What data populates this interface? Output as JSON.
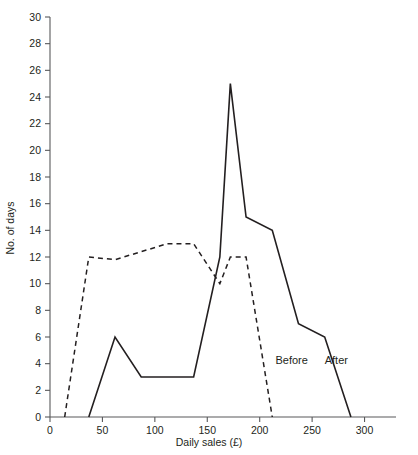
{
  "chart_data": {
    "type": "line",
    "title": "",
    "xlabel": "Daily sales (£)",
    "ylabel": "No. of days",
    "xlim": [
      0,
      330
    ],
    "ylim": [
      0,
      30
    ],
    "xticks": [
      0,
      50,
      100,
      150,
      200,
      250,
      300
    ],
    "yticks": [
      0,
      2,
      4,
      6,
      8,
      10,
      12,
      14,
      16,
      18,
      20,
      22,
      24,
      26,
      28,
      30
    ],
    "grid": false,
    "legend_position": "inline-annotations",
    "series": [
      {
        "name": "Before",
        "style": "dashed",
        "x": [
          14,
          37,
          62,
          87,
          112,
          137,
          162,
          172,
          187,
          212
        ],
        "y": [
          0,
          12,
          11.8,
          12.4,
          13,
          13,
          10,
          12,
          12,
          0
        ]
      },
      {
        "name": "After",
        "style": "solid",
        "x": [
          37,
          62,
          87,
          137,
          162,
          172,
          187,
          212,
          237,
          262,
          287
        ],
        "y": [
          0,
          6,
          3,
          3,
          12,
          25,
          15,
          14,
          7,
          6,
          0
        ]
      }
    ],
    "annotations": [
      {
        "text": "Before",
        "x": 215,
        "y": 4
      },
      {
        "text": "After",
        "x": 262,
        "y": 4
      }
    ]
  },
  "axes": {
    "y_tick_labels": [
      "30",
      "28",
      "26",
      "24",
      "22",
      "20",
      "18",
      "16",
      "14",
      "12",
      "10",
      "8",
      "6",
      "4",
      "2",
      "0"
    ],
    "x_tick_labels": [
      "0",
      "50",
      "100",
      "150",
      "200",
      "250",
      "300"
    ],
    "x_axis_title": "Daily sales (£)",
    "y_axis_title": "No. of days"
  },
  "colors": {
    "line": "#231f20",
    "axis": "#58595b",
    "background": "#ffffff"
  }
}
